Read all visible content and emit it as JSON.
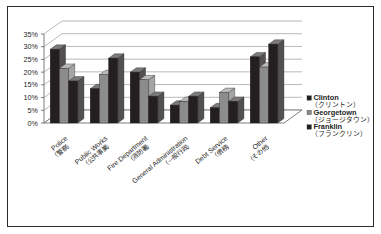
{
  "chart_data": {
    "type": "bar",
    "title": "",
    "subtitle": "",
    "xlabel": "",
    "ylabel": "",
    "ylim": [
      0,
      35
    ],
    "grid": true,
    "legend_position": "right",
    "style": "3d-clustered-column",
    "categories": [
      "Police",
      "Public Works",
      "Fire Department",
      "General Administration",
      "Debt Service",
      "Other"
    ],
    "categories_jp": [
      "（警察）",
      "（公共事業）",
      "（消防署）",
      "（一般行政）",
      "（債務）",
      "（その他）"
    ],
    "ytick_labels": [
      "0%",
      "5%",
      "10%",
      "15%",
      "20%",
      "25%",
      "30%",
      "35%"
    ],
    "ytick_values": [
      0,
      5,
      10,
      15,
      20,
      25,
      30,
      35
    ],
    "series": [
      {
        "name": "Clinton",
        "name_jp": "（クリントン）",
        "color": "#231f20",
        "values": [
          29,
          13.5,
          20,
          7,
          6,
          26
        ]
      },
      {
        "name": "Georgetown",
        "name_jp": "（ジョージタウン）",
        "color": "#8c8c8c",
        "values": [
          21.5,
          19,
          17,
          8.5,
          12,
          22
        ]
      },
      {
        "name": "Franklin",
        "name_jp": "（フランクリン）",
        "color": "#231f20",
        "values": [
          16.5,
          25.5,
          10.5,
          10.5,
          8.5,
          31
        ]
      }
    ]
  },
  "colors": {
    "border": "#2b2b2b",
    "background": "#ffffff",
    "axis": "#6f6f6f",
    "gridline": "#9a9a9a",
    "text": "#1d1d1d",
    "series_dark": "#231f20",
    "series_gray": "#8c8c8c",
    "series_dark_side": "#4a4647",
    "series_gray_side": "#6d6d6d",
    "series_dark_top": "#5d585a",
    "series_gray_top": "#b4b4b4",
    "floor": "#ffffff"
  }
}
